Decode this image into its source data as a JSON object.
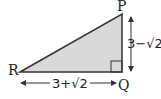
{
  "diagram": {
    "type": "right-triangle",
    "vertices": {
      "P": {
        "label": "P"
      },
      "Q": {
        "label": "Q"
      },
      "R": {
        "label": "R"
      }
    },
    "right_angle_at": "Q",
    "sides": {
      "PQ": {
        "length_label": "3−√2"
      },
      "RQ": {
        "length_label": "3+√2"
      }
    },
    "colors": {
      "fill": "#d9d9d9",
      "stroke": "#333333"
    }
  }
}
